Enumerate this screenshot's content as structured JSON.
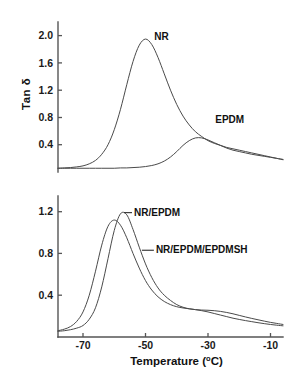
{
  "figure": {
    "x_axis_title_main": "Temperature (",
    "x_axis_title_sup": "o",
    "x_axis_title_tail": "C)",
    "y_axis_title": "Tan δ"
  },
  "chart_data": [
    {
      "type": "line",
      "panel": "top",
      "title": "",
      "xlabel": "Temperature (°C)",
      "ylabel": "Tan δ",
      "xlim": [
        -78,
        -6
      ],
      "ylim": [
        0.0,
        2.2
      ],
      "xticks": [
        -70,
        -50,
        -30,
        -10
      ],
      "yticks": [
        0.4,
        0.8,
        1.2,
        1.6,
        2.0
      ],
      "ytick_labels": [
        "0.4",
        "0.8",
        "1.2",
        "1.6",
        "2.0"
      ],
      "grid": false,
      "legend": "inline-annotations",
      "annotations": [
        {
          "text": "NR",
          "x": -47.5,
          "y": 1.93
        },
        {
          "text": "EPDM",
          "x": -28.0,
          "y": 0.72
        }
      ],
      "series": [
        {
          "name": "NR",
          "x": [
            -78,
            -76,
            -74,
            -72,
            -70,
            -68,
            -66,
            -64,
            -62,
            -60,
            -58,
            -56,
            -54,
            -52,
            -50,
            -48,
            -46,
            -44,
            -42,
            -40,
            -38,
            -36,
            -34,
            -32,
            -30,
            -28,
            -26,
            -24,
            -22,
            -20,
            -18,
            -16,
            -14,
            -12,
            -10,
            -8,
            -6
          ],
          "y": [
            0.055,
            0.06,
            0.065,
            0.075,
            0.09,
            0.12,
            0.17,
            0.26,
            0.4,
            0.62,
            0.92,
            1.28,
            1.62,
            1.86,
            1.95,
            1.87,
            1.68,
            1.44,
            1.2,
            0.99,
            0.82,
            0.69,
            0.59,
            0.52,
            0.46,
            0.42,
            0.39,
            0.36,
            0.34,
            0.32,
            0.3,
            0.28,
            0.26,
            0.24,
            0.22,
            0.2,
            0.18
          ]
        },
        {
          "name": "EPDM",
          "x": [
            -78,
            -76,
            -74,
            -72,
            -70,
            -68,
            -66,
            -64,
            -62,
            -60,
            -58,
            -56,
            -54,
            -52,
            -50,
            -48,
            -46,
            -44,
            -42,
            -40,
            -38,
            -36,
            -34,
            -32,
            -30,
            -28,
            -26,
            -24,
            -22,
            -20,
            -18,
            -16,
            -14,
            -12,
            -10,
            -8,
            -6
          ],
          "y": [
            0.055,
            0.055,
            0.055,
            0.055,
            0.055,
            0.055,
            0.055,
            0.055,
            0.055,
            0.055,
            0.06,
            0.06,
            0.065,
            0.07,
            0.08,
            0.095,
            0.12,
            0.16,
            0.22,
            0.3,
            0.39,
            0.46,
            0.5,
            0.5,
            0.47,
            0.43,
            0.39,
            0.35,
            0.32,
            0.3,
            0.28,
            0.26,
            0.245,
            0.23,
            0.215,
            0.2,
            0.185
          ]
        }
      ]
    },
    {
      "type": "line",
      "panel": "bottom",
      "title": "",
      "xlabel": "Temperature (°C)",
      "ylabel": "Tan δ",
      "xlim": [
        -78,
        -6
      ],
      "ylim": [
        0.0,
        1.35
      ],
      "xticks": [
        -70,
        -50,
        -30,
        -10
      ],
      "xtick_labels": [
        "-70",
        "-50",
        "-30",
        "-10"
      ],
      "yticks": [
        0.4,
        0.8,
        1.2
      ],
      "ytick_labels": [
        "0.4",
        "0.8",
        "1.2"
      ],
      "grid": false,
      "legend": "inline-annotations",
      "annotations": [
        {
          "text": "NR/EPDM",
          "x": -54.0,
          "y": 1.16
        },
        {
          "text": "NR/EPDM/EPDMSH",
          "x": -47.0,
          "y": 0.8
        }
      ],
      "series": [
        {
          "name": "NR/EPDM",
          "x": [
            -78,
            -76,
            -74,
            -72,
            -70,
            -68,
            -66,
            -64,
            -62,
            -60,
            -58,
            -56,
            -54,
            -52,
            -50,
            -48,
            -46,
            -44,
            -42,
            -40,
            -38,
            -36,
            -34,
            -32,
            -30,
            -28,
            -26,
            -24,
            -22,
            -20,
            -18,
            -16,
            -14,
            -12,
            -10,
            -8,
            -6
          ],
          "y": [
            0.055,
            0.06,
            0.07,
            0.085,
            0.11,
            0.17,
            0.28,
            0.48,
            0.75,
            1.02,
            1.18,
            1.17,
            1.03,
            0.86,
            0.7,
            0.57,
            0.47,
            0.4,
            0.35,
            0.31,
            0.285,
            0.27,
            0.262,
            0.258,
            0.256,
            0.252,
            0.245,
            0.235,
            0.222,
            0.207,
            0.192,
            0.178,
            0.165,
            0.152,
            0.14,
            0.13,
            0.12
          ]
        },
        {
          "name": "NR/EPDM/EPDMSH",
          "x": [
            -78,
            -76,
            -74,
            -72,
            -70,
            -68,
            -66,
            -64,
            -62,
            -60,
            -58,
            -56,
            -54,
            -52,
            -50,
            -48,
            -46,
            -44,
            -42,
            -40,
            -38,
            -36,
            -34,
            -32,
            -30,
            -28,
            -26,
            -24,
            -22,
            -20,
            -18,
            -16,
            -14,
            -12,
            -10,
            -8,
            -6
          ],
          "y": [
            0.06,
            0.075,
            0.1,
            0.15,
            0.24,
            0.4,
            0.63,
            0.88,
            1.06,
            1.12,
            1.07,
            0.95,
            0.8,
            0.66,
            0.54,
            0.45,
            0.385,
            0.34,
            0.31,
            0.29,
            0.278,
            0.27,
            0.262,
            0.252,
            0.24,
            0.225,
            0.21,
            0.195,
            0.18,
            0.168,
            0.157,
            0.147,
            0.137,
            0.128,
            0.12,
            0.113,
            0.107
          ]
        }
      ]
    }
  ]
}
